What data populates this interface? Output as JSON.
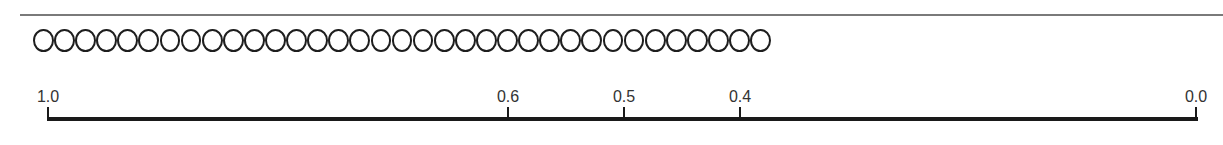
{
  "diagram": {
    "top_rule": {
      "color": "#7a7a7a"
    },
    "circle_row": {
      "count": 35,
      "symbol": "O",
      "stroke_color": "#1e1e1e"
    },
    "scale": {
      "axis_color": "#1a1a1a",
      "ticks": [
        {
          "label": "1.0",
          "value": 1.0,
          "x": 48
        },
        {
          "label": "0.6",
          "value": 0.6,
          "x": 508
        },
        {
          "label": "0.5",
          "value": 0.5,
          "x": 624
        },
        {
          "label": "0.4",
          "value": 0.4,
          "x": 740
        },
        {
          "label": "0.0",
          "value": 0.0,
          "x": 1196
        }
      ]
    }
  }
}
